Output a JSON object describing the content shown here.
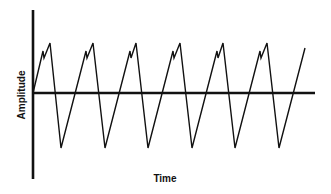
{
  "chart_data": {
    "type": "line",
    "title": "",
    "xlabel": "Time",
    "ylabel": "Amplitude",
    "grid": false,
    "legend": null,
    "ylim": [
      -1.0,
      1.0
    ],
    "series": [
      {
        "name": "waveform",
        "points_px": [
          [
            33,
            93
          ],
          [
            43,
            51
          ],
          [
            44,
            58
          ],
          [
            50,
            43
          ],
          [
            61,
            148
          ],
          [
            86,
            51
          ],
          [
            87,
            58
          ],
          [
            93,
            43
          ],
          [
            105,
            148
          ],
          [
            130,
            51
          ],
          [
            131,
            58
          ],
          [
            136,
            43
          ],
          [
            148,
            148
          ],
          [
            173,
            51
          ],
          [
            174,
            58
          ],
          [
            180,
            43
          ],
          [
            192,
            148
          ],
          [
            217,
            51
          ],
          [
            218,
            58
          ],
          [
            223,
            43
          ],
          [
            235,
            148
          ],
          [
            260,
            51
          ],
          [
            261,
            58
          ],
          [
            267,
            43
          ],
          [
            279,
            148
          ],
          [
            305,
            48
          ]
        ],
        "normalized_values": [
          0.0,
          0.8,
          0.67,
          0.95,
          -1.0,
          0.8,
          0.67,
          0.95,
          -1.0,
          0.8,
          0.67,
          0.95,
          -1.0,
          0.8,
          0.67,
          0.95,
          -1.0,
          0.8,
          0.67,
          0.95,
          -1.0,
          0.8,
          0.67,
          0.95,
          -1.0,
          0.86
        ]
      }
    ],
    "cycles": 6
  },
  "labels": {
    "x_axis": "Time",
    "y_axis": "Amplitude"
  },
  "colors": {
    "line": "#111111",
    "background": "#ffffff"
  }
}
